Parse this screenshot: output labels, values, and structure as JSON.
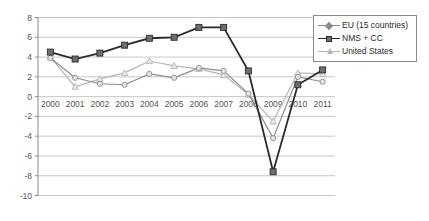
{
  "chart_data": {
    "type": "line",
    "title": "",
    "xlabel": "",
    "ylabel": "",
    "x": [
      "2000",
      "2001",
      "2002",
      "2003",
      "2004",
      "2005",
      "2006",
      "2007",
      "2008",
      "2009",
      "2010",
      "2011"
    ],
    "categories": [
      "2000",
      "2001",
      "2002",
      "2003",
      "2004",
      "2005",
      "2006",
      "2007",
      "2008",
      "2009",
      "2010",
      "2011"
    ],
    "ylim": [
      -10,
      8
    ],
    "yticks": [
      "8",
      "6",
      "4",
      "2",
      "0",
      "-2",
      "-4",
      "-6",
      "-8",
      "-10"
    ],
    "ytick_values": [
      8,
      6,
      4,
      2,
      0,
      -2,
      -4,
      -6,
      -8,
      -10
    ],
    "grid": true,
    "legend_position": "top-right",
    "series": [
      {
        "name": "EU (15 countries)",
        "color": "#8c8c8c",
        "marker": "diamond",
        "values": [
          3.9,
          1.9,
          1.3,
          1.2,
          2.3,
          1.9,
          2.9,
          2.6,
          0.3,
          -4.2,
          2.0,
          1.5
        ]
      },
      {
        "name": "NMS + CC",
        "color": "#2a2a2a",
        "marker": "square",
        "values": [
          4.5,
          3.8,
          4.4,
          5.2,
          5.9,
          6.0,
          7.0,
          7.0,
          2.6,
          -7.6,
          1.2,
          2.7
        ]
      },
      {
        "name": "United States",
        "color": "#b5b5b5",
        "marker": "triangle",
        "values": [
          4.0,
          1.0,
          1.8,
          2.4,
          3.6,
          3.1,
          2.8,
          2.2,
          0.2,
          -2.5,
          2.4,
          2.3
        ]
      }
    ]
  },
  "legend": {
    "entries": [
      {
        "label": "EU (15 countries)"
      },
      {
        "label": "NMS + CC"
      },
      {
        "label": "United States"
      }
    ]
  }
}
